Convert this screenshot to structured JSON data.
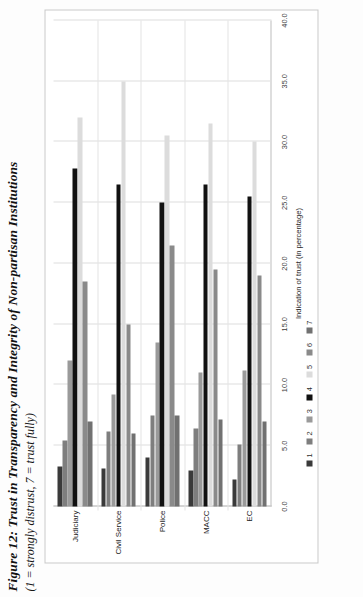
{
  "figure": {
    "title": "Figure 12: Trust in Transparency and Integrity of Non-partisan Institutions",
    "subtitle": "(1 = strongly distrust, 7 = trust fully)"
  },
  "chart_data": {
    "type": "bar",
    "orientation": "horizontal",
    "title": "Figure 12: Trust in Transparency and Integrity of Non-partisan Institutions",
    "subtitle": "(1 = strongly distrust, 7 = trust fully)",
    "xlabel": "Indication of trust (in percentage)",
    "ylabel": "",
    "xlim": [
      0.0,
      40.0
    ],
    "xticks": [
      "0.0",
      "5.0",
      "10.0",
      "15.0",
      "20.0",
      "25.0",
      "30.0",
      "35.0",
      "40.0"
    ],
    "xtick_values": [
      0,
      5,
      10,
      15,
      20,
      25,
      30,
      35,
      40
    ],
    "grid": true,
    "legend_position": "bottom",
    "legend_title": "",
    "categories": [
      "Judiciary",
      "Civil Service",
      "Police",
      "MACC",
      "EC"
    ],
    "series": [
      {
        "name": "1",
        "color": "#3a3a3a",
        "values": [
          3.3,
          3.1,
          4.0,
          3.0,
          2.2
        ]
      },
      {
        "name": "2",
        "color": "#7e7e7e",
        "values": [
          5.4,
          6.2,
          7.5,
          6.4,
          5.1
        ]
      },
      {
        "name": "3",
        "color": "#9a9a9a",
        "values": [
          12.0,
          9.2,
          13.5,
          11.0,
          11.2
        ]
      },
      {
        "name": "4",
        "color": "#111111",
        "values": [
          27.8,
          26.5,
          25.0,
          26.5,
          25.5
        ]
      },
      {
        "name": "5",
        "color": "#dcdcdc",
        "values": [
          32.0,
          35.0,
          30.5,
          31.5,
          30.0
        ]
      },
      {
        "name": "6",
        "color": "#8a8a8a",
        "values": [
          18.5,
          15.0,
          21.5,
          19.5,
          19.0
        ]
      },
      {
        "name": "7",
        "color": "#717171",
        "values": [
          7.0,
          6.0,
          7.5,
          7.2,
          7.0
        ]
      }
    ],
    "legend_entries": [
      "1",
      "2",
      "3",
      "4",
      "5",
      "6",
      "7"
    ]
  }
}
